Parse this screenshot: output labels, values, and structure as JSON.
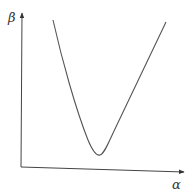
{
  "diagram": {
    "y_axis_label": "β",
    "x_axis_label": "α",
    "curve": {
      "description": "U/V-shaped curve with a single minimum",
      "points": [
        [
          53,
          20
        ],
        [
          60,
          50
        ],
        [
          68,
          80
        ],
        [
          76,
          108
        ],
        [
          84,
          132
        ],
        [
          90,
          147
        ],
        [
          95,
          154
        ],
        [
          99,
          155
        ],
        [
          104,
          150
        ],
        [
          112,
          135
        ],
        [
          124,
          110
        ],
        [
          138,
          80
        ],
        [
          152,
          51
        ],
        [
          166,
          22
        ]
      ]
    },
    "colors": {
      "line": "#555555",
      "background": "#ffffff",
      "text": "#333333"
    }
  }
}
